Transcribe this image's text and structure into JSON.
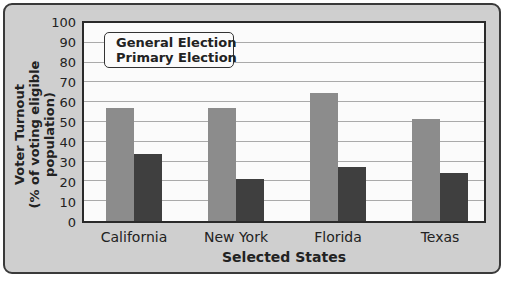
{
  "chart_data": {
    "type": "bar",
    "title": "",
    "xlabel": "Selected States",
    "ylabel": "Voter Turnout (% of voting eligible population)",
    "ylabel_lines": [
      "Voter Turnout",
      "(% of voting eligible population)"
    ],
    "ylim": [
      0,
      100
    ],
    "yticks": [
      0,
      10,
      20,
      30,
      40,
      50,
      60,
      70,
      80,
      90,
      100
    ],
    "grid": true,
    "legend_position": "top-left inside",
    "categories": [
      "California",
      "New York",
      "Florida",
      "Texas"
    ],
    "series": [
      {
        "name": "General Election",
        "color": "#8c8c8c",
        "values": [
          57,
          57,
          64.5,
          51.5
        ]
      },
      {
        "name": "Primary Election",
        "color": "#3f3f3f",
        "values": [
          34,
          21,
          27.5,
          24
        ]
      }
    ]
  }
}
